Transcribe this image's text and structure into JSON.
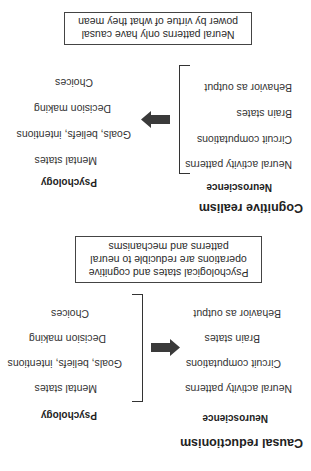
{
  "sections": [
    {
      "title": "Causal reductionism",
      "columns": {
        "left_header": "Neuroscience",
        "right_header": "Psychology"
      },
      "neuroscience_items": [
        "Neural activity patterns",
        "Circuit computations",
        "Brain states",
        "Behavior as output"
      ],
      "psychology_items": [
        "Mental states",
        "Goals, beliefs, intentions",
        "Decision making",
        "Choices"
      ],
      "arrow_direction": "psychology-to-neuroscience",
      "bracket_side": "psychology",
      "summary": "Psychological states and cognitive operations are reducible to neural patterns and mechanisms"
    },
    {
      "title": "Cognitive realism",
      "columns": {
        "left_header": "Neuroscience",
        "right_header": "Psychology"
      },
      "neuroscience_items": [
        "Neural activity patterns",
        "Circuit computations",
        "Brain states",
        "Behavior as output"
      ],
      "psychology_items": [
        "Mental states",
        "Goals, beliefs, intentions",
        "Decision making",
        "Choices"
      ],
      "arrow_direction": "neuroscience-to-psychology",
      "bracket_side": "neuroscience",
      "summary": "Neural patterns only have causal power by virtue of what they mean"
    }
  ],
  "orientation": "rotated-180",
  "colors": {
    "text": "#2a2a2a",
    "arrow": "#3a3a3a",
    "lines": "#333333",
    "background": "#ffffff"
  }
}
